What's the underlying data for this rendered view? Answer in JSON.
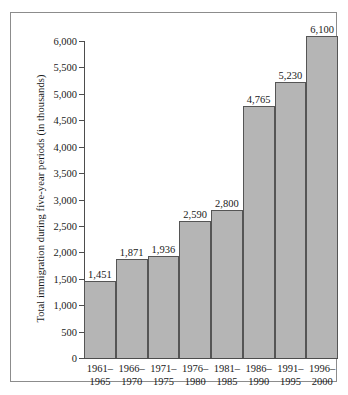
{
  "chart_data": {
    "type": "bar",
    "title": "",
    "xlabel": "",
    "ylabel": "Total immigration during five-year periods (in thousands)",
    "ylim": [
      0,
      6000
    ],
    "grid": false,
    "legend": null,
    "y_ticks": [
      "0",
      "500",
      "1,000",
      "1,500",
      "2,000",
      "2,500",
      "3,000",
      "3,500",
      "4,000",
      "4,500",
      "5,000",
      "5,500",
      "6,000"
    ],
    "y_tick_values": [
      0,
      500,
      1000,
      1500,
      2000,
      2500,
      3000,
      3500,
      4000,
      4500,
      5000,
      5500,
      6000
    ],
    "categories": [
      "1961–1965",
      "1966–1970",
      "1971–1975",
      "1976–1980",
      "1981–1985",
      "1986–1990",
      "1991–1995",
      "1996–2000"
    ],
    "category_lines": [
      [
        "1961–",
        "1965"
      ],
      [
        "1966–",
        "1970"
      ],
      [
        "1971–",
        "1975"
      ],
      [
        "1976–",
        "1980"
      ],
      [
        "1981–",
        "1985"
      ],
      [
        "1986–",
        "1990"
      ],
      [
        "1991–",
        "1995"
      ],
      [
        "1996–",
        "2000"
      ]
    ],
    "values": [
      1451,
      1871,
      1936,
      2590,
      2800,
      4765,
      5230,
      6100
    ],
    "value_labels": [
      "1,451",
      "1,871",
      "1,936",
      "2,590",
      "2,800",
      "4,765",
      "5,230",
      "6,100"
    ],
    "bar_fill_color": "#b5b5b5",
    "bar_border_color": "#555555",
    "axis_color": "#4d4d4d",
    "frame_color": "#8c8c8c",
    "background_color": "#ffffff"
  }
}
